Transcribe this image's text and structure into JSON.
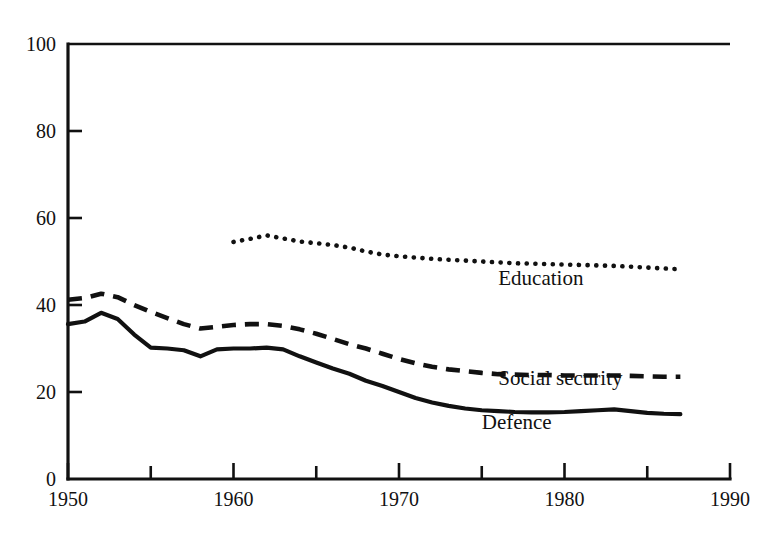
{
  "chart_data": {
    "type": "line",
    "title": "",
    "subtitle": "",
    "xlabel": "",
    "ylabel": "",
    "xlim": [
      1950,
      1990
    ],
    "ylim": [
      0,
      100
    ],
    "grid": false,
    "legend_position": "inline-annotations",
    "x_tick_labels": [
      "1950",
      "1960",
      "1970",
      "1980",
      "1990"
    ],
    "x_tick_values": [
      1950,
      1960,
      1970,
      1980,
      1990
    ],
    "x_minor_tick_values": [
      1955,
      1965,
      1975,
      1985
    ],
    "y_tick_labels": [
      "0",
      "20",
      "40",
      "60",
      "80",
      "100"
    ],
    "y_tick_values": [
      0,
      20,
      40,
      60,
      80,
      100
    ],
    "series": [
      {
        "name": "Education",
        "style": "dotted",
        "label_x": 1976,
        "label_y": 44.5,
        "x": [
          1960,
          1961,
          1962,
          1963,
          1964,
          1965,
          1966,
          1967,
          1968,
          1969,
          1970,
          1971,
          1972,
          1973,
          1974,
          1975,
          1976,
          1977,
          1978,
          1979,
          1980,
          1981,
          1982,
          1983,
          1984,
          1985,
          1986,
          1987
        ],
        "values": [
          54.5,
          55.2,
          56.0,
          55.3,
          54.6,
          54.2,
          53.8,
          53.2,
          52.3,
          51.6,
          51.2,
          50.9,
          50.6,
          50.4,
          50.2,
          50.0,
          49.8,
          49.6,
          49.5,
          49.4,
          49.3,
          49.2,
          49.1,
          49.0,
          48.8,
          48.6,
          48.4,
          48.2
        ]
      },
      {
        "name": "Social security",
        "style": "dashed",
        "label_x": 1976,
        "label_y": 21.5,
        "x": [
          1950,
          1951,
          1952,
          1953,
          1954,
          1955,
          1956,
          1957,
          1958,
          1959,
          1960,
          1961,
          1962,
          1963,
          1964,
          1965,
          1966,
          1967,
          1968,
          1969,
          1970,
          1971,
          1972,
          1973,
          1974,
          1975,
          1976,
          1977,
          1978,
          1979,
          1980,
          1981,
          1982,
          1983,
          1984,
          1985,
          1986,
          1987
        ],
        "values": [
          41.2,
          41.6,
          42.6,
          41.8,
          40.0,
          38.4,
          37.0,
          35.6,
          34.6,
          35.0,
          35.4,
          35.6,
          35.6,
          35.2,
          34.4,
          33.4,
          32.2,
          31.0,
          30.0,
          28.8,
          27.6,
          26.6,
          25.8,
          25.2,
          24.8,
          24.4,
          24.1,
          24.0,
          23.9,
          23.9,
          23.8,
          23.8,
          23.8,
          23.8,
          23.7,
          23.6,
          23.5,
          23.5
        ]
      },
      {
        "name": "Defence",
        "style": "solid",
        "label_x": 1975,
        "label_y": 11.5,
        "x": [
          1950,
          1951,
          1952,
          1953,
          1954,
          1955,
          1956,
          1957,
          1958,
          1959,
          1960,
          1961,
          1962,
          1963,
          1964,
          1965,
          1966,
          1967,
          1968,
          1969,
          1970,
          1971,
          1972,
          1973,
          1974,
          1975,
          1976,
          1977,
          1978,
          1979,
          1980,
          1981,
          1982,
          1983,
          1984,
          1985,
          1986,
          1987
        ],
        "values": [
          35.6,
          36.2,
          38.2,
          36.8,
          33.2,
          30.2,
          30.0,
          29.6,
          28.2,
          29.8,
          30.0,
          30.0,
          30.2,
          29.8,
          28.2,
          26.8,
          25.4,
          24.2,
          22.6,
          21.4,
          20.0,
          18.6,
          17.6,
          16.8,
          16.2,
          15.8,
          15.6,
          15.4,
          15.3,
          15.3,
          15.4,
          15.6,
          15.8,
          16.0,
          15.6,
          15.2,
          15.0,
          14.9
        ]
      }
    ]
  },
  "axes": {
    "frame_note": "left vertical axis with outward ticks; bottom horizontal axis with upward ticks; horizontal rule at y=100"
  }
}
